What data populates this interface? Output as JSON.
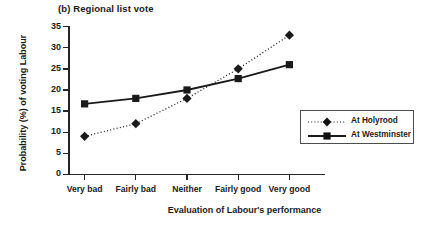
{
  "figure": {
    "title": "(b) Regional list vote"
  },
  "chart_data": {
    "type": "line",
    "title": "(b) Regional list vote",
    "xlabel": "Evaluation of Labour's performance",
    "ylabel": "Probability (%) of voting Labour",
    "categories": [
      "Very bad",
      "Fairly bad",
      "Neither",
      "Fairly good",
      "Very good"
    ],
    "yticks": [
      0,
      5,
      10,
      15,
      20,
      25,
      30,
      35
    ],
    "ylim": [
      0,
      35
    ],
    "grid": false,
    "legend_position": "right",
    "series": [
      {
        "name": "At Holyrood",
        "values": [
          9,
          12,
          18,
          25,
          33
        ],
        "marker": "diamond",
        "linestyle": "dotted",
        "color": "#1a1a1a"
      },
      {
        "name": "At Westminster",
        "values": [
          16.7,
          18,
          20,
          22.7,
          26
        ],
        "marker": "square",
        "linestyle": "solid",
        "color": "#1a1a1a"
      }
    ]
  }
}
